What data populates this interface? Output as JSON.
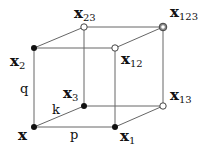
{
  "diagram": {
    "type": "cube-lattice",
    "colors": {
      "line": "#666666",
      "filled": "#111111",
      "hollow_fill": "#ffffff"
    },
    "vertices": [
      {
        "id": "x",
        "base": "x",
        "sub": "",
        "cx": 34,
        "cy": 127,
        "style": "filled"
      },
      {
        "id": "x1",
        "base": "x",
        "sub": "1",
        "cx": 115,
        "cy": 127,
        "style": "filled"
      },
      {
        "id": "x2",
        "base": "x",
        "sub": "2",
        "cx": 34,
        "cy": 48,
        "style": "filled"
      },
      {
        "id": "x3",
        "base": "x",
        "sub": "3",
        "cx": 84,
        "cy": 106,
        "style": "filled"
      },
      {
        "id": "x12",
        "base": "x",
        "sub": "12",
        "cx": 115,
        "cy": 48,
        "style": "hollow"
      },
      {
        "id": "x13",
        "base": "x",
        "sub": "13",
        "cx": 163,
        "cy": 106,
        "style": "hollow"
      },
      {
        "id": "x23",
        "base": "x",
        "sub": "23",
        "cx": 84,
        "cy": 27,
        "style": "hollow"
      },
      {
        "id": "x123",
        "base": "x",
        "sub": "123",
        "cx": 163,
        "cy": 27,
        "style": "double"
      }
    ],
    "edge_labels": {
      "p": "p",
      "q": "q",
      "k": "k"
    }
  }
}
